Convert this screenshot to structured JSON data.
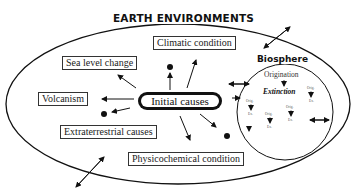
{
  "diagram": {
    "title": "EARTH ENVIRONMENTS",
    "center_node": "Initial causes",
    "causes": [
      {
        "id": "climatic",
        "label": "Climatic condition"
      },
      {
        "id": "sea-level",
        "label": "Sea level change"
      },
      {
        "id": "volcanism",
        "label": "Volcanism"
      },
      {
        "id": "extraterrestrial",
        "label": "Extraterrestrial causes"
      },
      {
        "id": "physicochemical",
        "label": "Physicochemical condition"
      }
    ],
    "biosphere": {
      "title": "Biosphere",
      "main_origination": "Origination",
      "main_extinction": "Extinction",
      "mini_pairs": [
        {
          "orig": "Orig.",
          "ex": "Ex."
        },
        {
          "orig": "Orig.",
          "ex": "Ex."
        },
        {
          "orig": "Orig.",
          "ex": "Ex."
        },
        {
          "orig": "Orig.",
          "ex": "Ex."
        },
        {
          "orig": "Orig.",
          "ex": "Ex."
        }
      ]
    }
  }
}
